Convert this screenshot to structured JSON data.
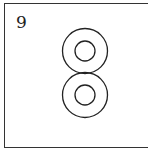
{
  "figure": {
    "label": "9",
    "shapes": [
      {
        "type": "concentric-circles",
        "cx": 85,
        "cy": 51,
        "outer_r": 22.5,
        "inner_r": 10
      },
      {
        "type": "concentric-circles",
        "cx": 85,
        "cy": 95,
        "outer_r": 22.5,
        "inner_r": 10
      }
    ],
    "stroke_color": "#222222",
    "border_color": "#333333"
  }
}
